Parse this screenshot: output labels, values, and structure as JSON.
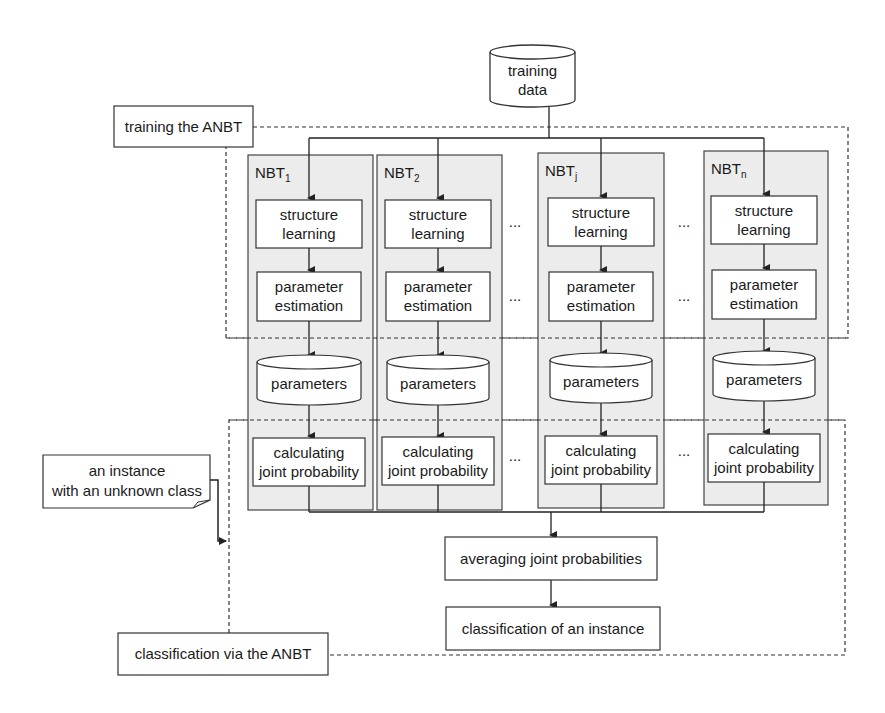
{
  "diagram": {
    "source_node": {
      "line1": "training",
      "line2": "data"
    },
    "phase_labels": {
      "training": "training the ANBT",
      "classification": "classification via the ANBT"
    },
    "input_note": {
      "line1": "an instance",
      "line2": "with an unknown class"
    },
    "panels": [
      {
        "title": "NBT",
        "subscript": "1"
      },
      {
        "title": "NBT",
        "subscript": "2"
      },
      {
        "title": "NBT",
        "subscript": "j"
      },
      {
        "title": "NBT",
        "subscript": "n"
      }
    ],
    "steps": {
      "structure_learning": {
        "line1": "structure",
        "line2": "learning"
      },
      "parameter_estimation": {
        "line1": "parameter",
        "line2": "estimation"
      },
      "parameters": "parameters",
      "joint_probability": {
        "line1": "calculating",
        "line2": "joint probability"
      }
    },
    "ellipsis": "...",
    "averaging": "averaging joint probabilities",
    "classification": "classification of an instance",
    "colors": {
      "panel_fill": "#ececec",
      "stroke": "#333333",
      "background": "#ffffff"
    }
  }
}
